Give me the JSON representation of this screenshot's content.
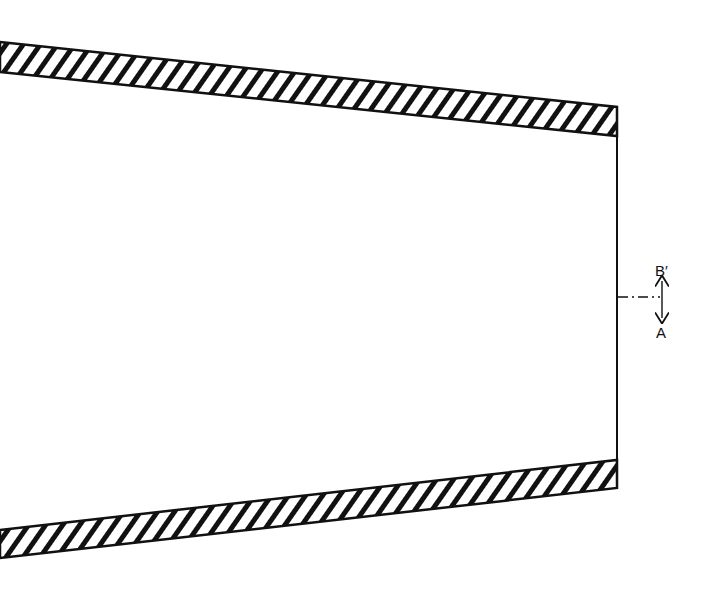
{
  "diagram": {
    "type": "cross-section of tapered nozzle / diffuser walls",
    "colors": {
      "ink": "#111111",
      "background": "#ffffff"
    },
    "top_wall": {
      "hatched": true,
      "left_top": [
        0,
        42
      ],
      "left_bottom": [
        0,
        72
      ],
      "right_top": [
        617,
        107
      ],
      "right_bottom": [
        617,
        136
      ]
    },
    "bottom_wall": {
      "hatched": true,
      "left_top": [
        0,
        530
      ],
      "left_bottom": [
        0,
        558
      ],
      "right_top": [
        617,
        460
      ],
      "right_bottom": [
        617,
        488
      ]
    },
    "exit_plane": {
      "x": 617,
      "y_top": 136,
      "y_bottom": 460
    },
    "axis_mark": {
      "from": [
        617,
        297
      ],
      "to": [
        661,
        297
      ],
      "style": "dash-dot"
    },
    "labels": {
      "upper": "B′",
      "lower": "A"
    }
  }
}
